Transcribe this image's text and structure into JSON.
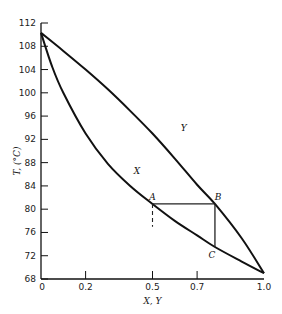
{
  "chart_data": {
    "type": "line",
    "title": "",
    "xlabel": "X, Y",
    "ylabel": "T, (°C)",
    "xlim": [
      0,
      1.0
    ],
    "ylim": [
      68,
      112
    ],
    "grid": false,
    "x_ticks": [
      "0",
      "0.2",
      "0.5",
      "0.7",
      "1.0"
    ],
    "x_tick_values": [
      0,
      0.2,
      0.5,
      0.7,
      1.0
    ],
    "y_ticks": [
      "68",
      "72",
      "76",
      "80",
      "84",
      "88",
      "92",
      "96",
      "100",
      "104",
      "108",
      "112"
    ],
    "y_tick_values": [
      68,
      72,
      76,
      80,
      84,
      88,
      92,
      96,
      100,
      104,
      108,
      112
    ],
    "series": [
      {
        "name": "X",
        "description": "liquid (bubble point) curve",
        "x": [
          0.0,
          0.05,
          0.1,
          0.2,
          0.3,
          0.4,
          0.5,
          0.6,
          0.7,
          0.78,
          0.9,
          1.0
        ],
        "y": [
          110.3,
          104.5,
          100.0,
          93.0,
          87.8,
          84.0,
          80.9,
          78.0,
          75.5,
          73.5,
          71.0,
          69.0
        ]
      },
      {
        "name": "Y",
        "description": "vapor (dew point) curve",
        "x": [
          0.0,
          0.1,
          0.2,
          0.3,
          0.4,
          0.5,
          0.6,
          0.7,
          0.78,
          0.9,
          1.0
        ],
        "y": [
          110.3,
          107.2,
          104.0,
          100.6,
          96.9,
          93.0,
          88.7,
          84.2,
          80.9,
          75.0,
          69.0
        ]
      }
    ],
    "annotations": [
      {
        "label": "A",
        "x": 0.5,
        "y": 80.9
      },
      {
        "label": "B",
        "x": 0.78,
        "y": 80.9
      },
      {
        "label": "C",
        "x": 0.78,
        "y": 73.5
      },
      {
        "label": "X",
        "x": 0.43,
        "y": 86.0,
        "role": "curve label"
      },
      {
        "label": "Y",
        "x": 0.64,
        "y": 93.5,
        "role": "curve label"
      }
    ],
    "tie_lines": [
      {
        "from": "A",
        "to": "B",
        "style": "solid"
      },
      {
        "from": "B",
        "to": "C",
        "style": "solid"
      },
      {
        "from": "A",
        "to_y": 77.0,
        "style": "dashed"
      }
    ]
  }
}
